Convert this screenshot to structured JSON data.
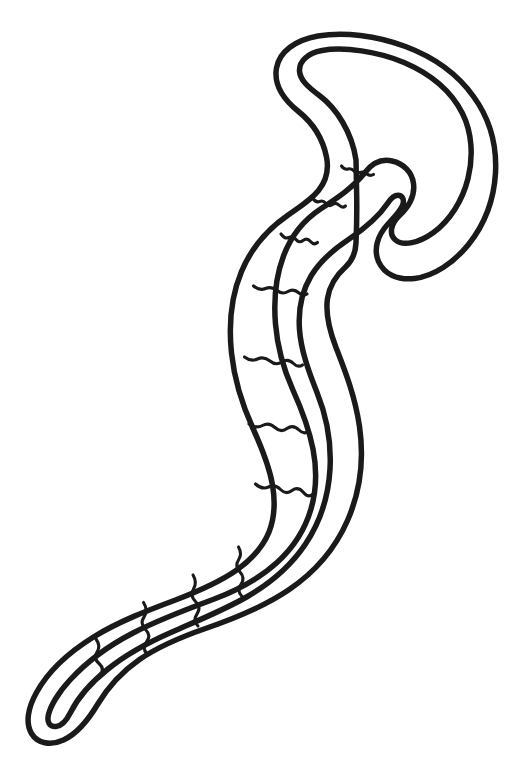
{
  "image": {
    "title": "Segmented Worm Line Drawing",
    "subject": "worm",
    "style": "black outline coloring-book line art",
    "background_color": "#ffffff",
    "stroke_color": "#1a1a1a",
    "fill_color": "#ffffff",
    "outline_stroke_width": 5.5,
    "segment_stroke_width": 3.1,
    "width": 512,
    "height": 779,
    "has_text": false,
    "has_border": false
  },
  "parts": {
    "head": {
      "name": "head",
      "description": "hammerhead / anchor-shaped flared head with a curled left hook and a curled right lobe",
      "bounds": {
        "x": 296,
        "y": 48,
        "width": 176,
        "height": 200
      }
    },
    "neck": {
      "name": "neck",
      "description": "narrow junction connecting the head to the body",
      "bounds": {
        "x": 330,
        "y": 140,
        "width": 60,
        "height": 50
      }
    },
    "body": {
      "name": "body",
      "description": "S-curved segmented trunk descending from upper right to lower left",
      "bounds": {
        "x": 180,
        "y": 150,
        "width": 180,
        "height": 470
      }
    },
    "tail": {
      "name": "tail",
      "description": "tapering pointed tail curving to the lower left",
      "bounds": {
        "x": 36,
        "y": 560,
        "width": 200,
        "height": 165
      }
    }
  },
  "geometry": {
    "outline_path": "M 356.0 160.0 C 352.0 132.0 336.0 108.0 320.0 96.0 C 308.0 87.0 300.0 80.0 299.5 71.0 C 299.0 61.0 308.0 53.0 322.0 50.5 C 344.0 46.5 378.0 51.5 404.0 62.5 C 432.0 74.5 452.0 92.5 462.5 113.5 C 472.0 132.5 473.5 156.5 468.0 178.5 C 462.5 200.5 450.0 220.5 433.5 232.5 C 419.0 243.0 403.0 246.5 395.5 240.0 C 388.5 234.0 391.0 223.5 399.5 215.5 C 409.0 206.5 415.0 195.0 413.5 183.5 C 412.0 172.0 403.5 163.5 392.0 161.0 C 381.0 158.5 372.0 163.5 365.0 172.5 C 353.0 187.5 338.0 197.5 320.5 209.0 C 303.0 220.5 291.0 236.0 283.5 256.0 C 276.0 276.0 273.5 300.0 275.5 324.0 C 277.5 348.0 284.0 370.0 292.5 389.0 C 301.5 409.0 309.0 428.5 313.0 449.0 C 317.0 469.5 316.5 490.0 311.0 509.0 C 305.0 529.5 293.5 547.5 277.0 562.5 C 260.0 578.0 238.0 590.0 213.0 599.5 C 186.0 609.5 159.0 619.5 133.0 633.0 C 108.0 646.0 86.0 662.5 70.0 680.0 C 58.0 693.0 50.5 706.5 48.5 714.5 C 46.5 722.5 50.0 727.0 56.0 726.5 C 62.0 726.0 66.5 720.5 70.5 712.5 C 78.0 697.5 91.0 682.5 108.0 669.0 C 126.0 654.5 148.0 642.5 172.0 632.0 C 198.0 620.5 224.0 610.0 247.5 596.5 C 271.5 582.5 291.5 565.0 305.5 544.0 C 320.5 521.5 328.5 496.0 330.0 469.0 C 331.5 442.0 326.5 416.0 317.0 392.5 C 308.5 371.0 301.0 350.5 299.5 329.5 C 298.0 309.0 302.0 291.0 311.0 276.0 C 320.0 261.0 333.5 249.5 348.5 239.5 C 364.0 229.0 378.0 217.5 387.5 203.5 C 391.5 197.5 395.5 194.5 399.5 195.5 C 403.0 196.5 404.5 200.5 402.5 205.5 C 400.0 211.5 393.5 218.0 387.5 224.5 C 377.0 236.0 373.5 250.0 378.5 261.5 C 384.0 274.0 397.5 280.5 414.5 278.5 C 434.0 276.0 453.5 263.0 468.5 244.5 C 484.5 224.5 494.0 199.0 495.5 173.0 C 497.0 145.5 489.5 118.5 473.5 96.5 C 457.5 74.0 433.5 57.0 405.5 46.5 C 376.5 35.5 343.5 31.5 318.0 36.0 C 295.5 40.0 279.5 51.5 276.5 68.0 C 273.5 85.0 283.5 99.5 298.5 111.5 C 311.0 121.5 322.5 137.0 326.5 157.0 C 329.0 169.5 326.5 180.5 318.5 190.5 C 311.0 200.0 299.5 207.0 287.5 215.5 C 268.0 229.0 251.5 247.5 241.5 271.5 C 231.5 295.5 228.5 324.5 231.5 353.0 C 234.5 381.5 243.0 406.5 253.0 428.5 C 262.5 449.5 269.5 467.5 272.5 485.0 C 275.5 502.5 274.5 518.0 269.0 532.0 C 263.0 547.0 251.5 559.5 236.0 570.5 C 219.5 582.0 199.0 591.0 175.5 600.0 C 147.5 610.5 118.5 621.5 93.5 637.0 C 68.5 652.5 47.5 672.5 36.5 692.5 C 27.5 708.5 25.5 723.5 31.5 733.5 C 37.5 743.5 50.5 746.0 63.5 740.0 C 77.5 733.5 88.5 719.5 97.5 704.5 C 108.0 687.0 121.5 672.0 139.5 659.5 C 158.5 646.5 181.0 637.0 205.5 628.5 C 234.5 618.5 263.5 607.0 288.5 590.0 C 314.5 572.5 335.0 549.0 347.5 520.5 C 360.5 491.0 364.0 458.0 359.5 426.5 C 355.0 395.5 344.5 369.5 336.0 347.5 C 328.5 328.0 325.5 312.0 327.5 298.5 C 329.5 285.5 336.0 275.5 345.5 267.0 C 352.0 261.0 355.5 253.5 356.0 243.0 C 356.5 232.0 357.0 206.0 356.5 186.0 Z",
    "segment_lines": [
      "M 341.5 166.0 q 3 4 6.5 3 q 3.5 -1 6 2 q 2.5 3 6 1.5 q 3.5 -1.5 7 1.5 q 3 2.5 6.5 0.5",
      "M 312.5 198.0 q 3.5 5 7 3.5 q 3.5 -1.5 6.5 2 q 3 3.5 6.5 1 q 3.5 -2.5 7 1 q 3 3 6 0.5",
      "M 281.0 234.0 q 4 5.5 8 3.5 q 4 -2 7 2 q 3 4 7 1 q 4 -3 7.5 1 q 3.5 4 7 1",
      "M 253.5 286.0 q 6 5 12 2.5 q 6 -2.5 11.5 2 q 5.5 4.5 11 1 q 5.5 -3.5 11 1.5 q 4 3.5 8 1",
      "M 244.5 357.0 q 6.5 5 13 2 q 6.5 -3 12.5 2 q 6 5 12 1 q 6 -4 11.5 1.5 q 4.5 4.5 9 1.5",
      "M 249.0 424.0 q 7 5 13.5 1.5 q 6.5 -3.5 12.5 2 q 6 5.5 12 1 q 6 -4.5 12 1.5 q 5 5 9.5 1",
      "M 255.5 484.0 q 6.5 6 13 3 q 6.5 -3 12 2.5 q 5.5 5.5 11.5 1 q 6 -4.5 11.5 2 q 4.5 5.5 9 2",
      "M 238.5 547.0 q 4 7 0 13 q -4 6 1.5 12 q 5.5 6 1 12.5 q -4.5 6.5 1 12",
      "M 193.0 575.0 q 4.5 7.5 0.5 14 q -4 6.5 2 12.5 q 6 6 1.5 12.5 q -4.5 6.5 1 12",
      "M 143.5 602.5 q 5 8 0.5 14.5 q -4.5 6.5 1.5 12.5 q 6 6 1 12.5 q -5 6.5 0.5 11.5",
      "M 96.0 639.0 q 5 7 1 13 q -4 6 2 11.5 q 6 5.5 1.5 11"
    ],
    "viewbox": "0 0 512 779"
  }
}
